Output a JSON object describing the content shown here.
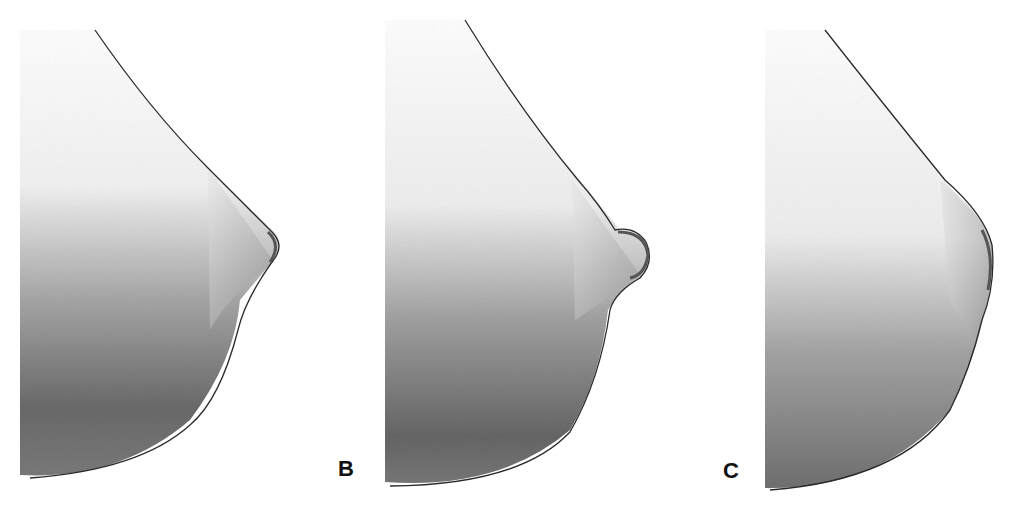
{
  "figure": {
    "panels": [
      {
        "label": "A",
        "visible_label": false
      },
      {
        "label": "B",
        "visible_label": true
      },
      {
        "label": "C",
        "visible_label": true
      }
    ]
  },
  "labels": {
    "b": "B",
    "c": "C"
  },
  "colors": {
    "background": "#ffffff",
    "outline": "#2a2a2a",
    "shade_dark": "#5a5a5a",
    "shade_mid": "#9a9a9a",
    "shade_light": "#e6e6e6",
    "label": "#111111"
  }
}
